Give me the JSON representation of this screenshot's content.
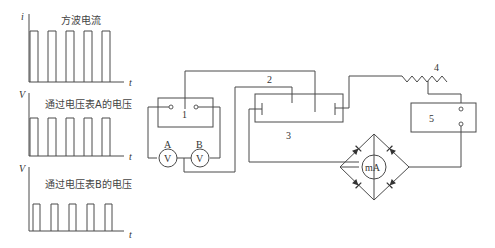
{
  "graphs": [
    {
      "y_label": "i",
      "x_label": "t",
      "caption": "方波电流"
    },
    {
      "y_label": "V",
      "x_label": "t",
      "caption": "通过电压表A的电压"
    },
    {
      "y_label": "V",
      "x_label": "t",
      "caption": "通过电压表B的电压"
    }
  ],
  "circuit": {
    "component_1": "1",
    "component_2": "2",
    "component_3": "3",
    "component_4": "4",
    "component_5": "5",
    "voltmeter_a_label": "A",
    "voltmeter_b_label": "B",
    "voltmeter_symbol": "V",
    "milliammeter_symbol": "mA"
  }
}
